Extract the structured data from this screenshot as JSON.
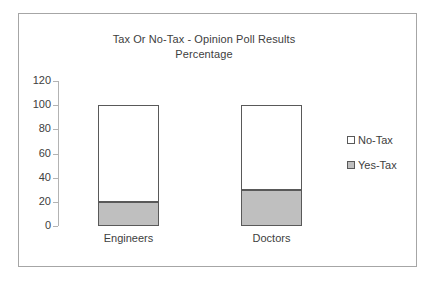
{
  "chart_data": {
    "type": "bar",
    "title": "Tax Or No-Tax - Opinion Poll Results Percentage",
    "title_lines": [
      "Tax Or No-Tax - Opinion Poll Results",
      "Percentage"
    ],
    "stacked": true,
    "xlabel": "",
    "ylabel": "",
    "ylim": [
      0,
      120
    ],
    "ytick_step": 20,
    "yticks": [
      120,
      100,
      80,
      60,
      40,
      20,
      0
    ],
    "grid": false,
    "legend_position": "right",
    "categories": [
      "Engineers",
      "Doctors"
    ],
    "series": [
      {
        "name": "No-Tax",
        "values": [
          80,
          70
        ],
        "color": "#ffffff"
      },
      {
        "name": "Yes-Tax",
        "values": [
          20,
          30
        ],
        "color": "#bfbfbf"
      }
    ],
    "totals": [
      100,
      100
    ]
  },
  "colors": {
    "no_tax": "#ffffff",
    "yes_tax": "#bfbfbf",
    "outline": "#595959",
    "axis": "#b3b3b3",
    "text": "#404040",
    "frame": "#a6a6a6"
  }
}
